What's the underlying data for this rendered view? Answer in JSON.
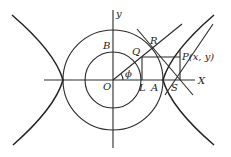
{
  "labels": {
    "y_axis": "y",
    "x_axis": "X",
    "origin": "O",
    "B": "B",
    "Q": "Q",
    "R": "R",
    "P": "P(x, y)",
    "L": "L",
    "A": "A",
    "S": "S",
    "phi": "ϕ"
  }
}
